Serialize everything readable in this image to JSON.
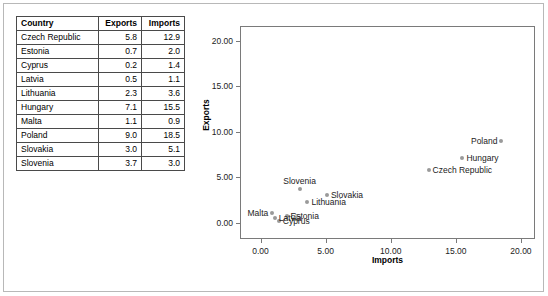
{
  "table": {
    "columns": [
      "Country",
      "Exports",
      "Imports"
    ],
    "rows": [
      {
        "country": "Czech Republic",
        "exports": "5.8",
        "imports": "12.9"
      },
      {
        "country": "Estonia",
        "exports": "0.7",
        "imports": "2.0"
      },
      {
        "country": "Cyprus",
        "exports": "0.2",
        "imports": "1.4"
      },
      {
        "country": "Latvia",
        "exports": "0.5",
        "imports": "1.1"
      },
      {
        "country": "Lithuania",
        "exports": "2.3",
        "imports": "3.6"
      },
      {
        "country": "Hungary",
        "exports": "7.1",
        "imports": "15.5"
      },
      {
        "country": "Malta",
        "exports": "1.1",
        "imports": "0.9"
      },
      {
        "country": "Poland",
        "exports": "9.0",
        "imports": "18.5"
      },
      {
        "country": "Slovakia",
        "exports": "3.0",
        "imports": "5.1"
      },
      {
        "country": "Slovenia",
        "exports": "3.7",
        "imports": "3.0"
      }
    ]
  },
  "chart_data": {
    "type": "scatter",
    "title": "",
    "xlabel": "Imports",
    "ylabel": "Exports",
    "xlim": [
      -1.5,
      21.0
    ],
    "ylim": [
      -1.7,
      21.5
    ],
    "xticks": [
      "0.00",
      "5.00",
      "10.00",
      "15.00",
      "20.00"
    ],
    "xtick_values": [
      0,
      5,
      10,
      15,
      20
    ],
    "yticks": [
      "0.00",
      "5.00",
      "10.00",
      "15.00",
      "20.00"
    ],
    "ytick_values": [
      0,
      5,
      10,
      15,
      20
    ],
    "grid": false,
    "legend": "none",
    "marker_color": "#9a9a9a",
    "points": [
      {
        "label": "Czech Republic",
        "x": 12.9,
        "y": 5.8,
        "label_pos": "right"
      },
      {
        "label": "Estonia",
        "x": 2.0,
        "y": 0.7,
        "label_pos": "right"
      },
      {
        "label": "Cyprus",
        "x": 1.4,
        "y": 0.2,
        "label_pos": "right"
      },
      {
        "label": "Latvia",
        "x": 1.1,
        "y": 0.5,
        "label_pos": "right"
      },
      {
        "label": "Lithuania",
        "x": 3.6,
        "y": 2.3,
        "label_pos": "right"
      },
      {
        "label": "Hungary",
        "x": 15.5,
        "y": 7.1,
        "label_pos": "right"
      },
      {
        "label": "Malta",
        "x": 0.9,
        "y": 1.1,
        "label_pos": "left"
      },
      {
        "label": "Poland",
        "x": 18.5,
        "y": 9.0,
        "label_pos": "left"
      },
      {
        "label": "Slovakia",
        "x": 5.1,
        "y": 3.0,
        "label_pos": "right"
      },
      {
        "label": "Slovenia",
        "x": 3.0,
        "y": 3.7,
        "label_pos": "above"
      }
    ]
  }
}
